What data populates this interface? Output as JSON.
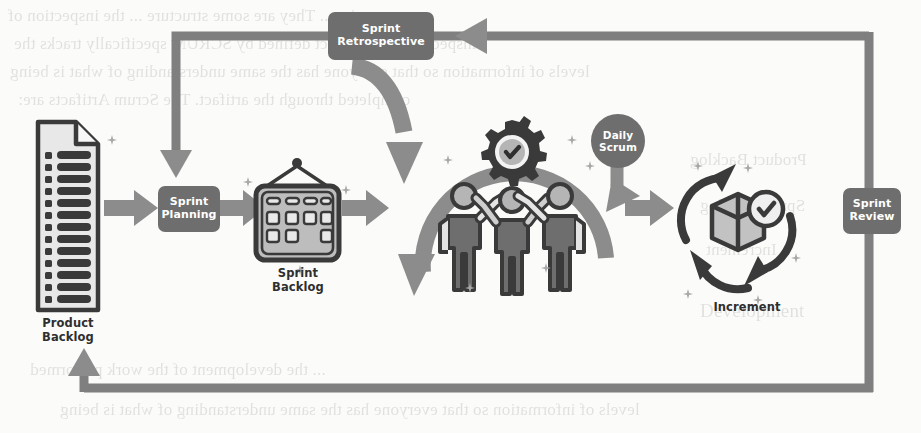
{
  "diagram": {
    "colors": {
      "badge_fill": "#6e6e6e",
      "badge_text": "#ffffff",
      "arrow_gray": "#8c8c8c",
      "line_gray": "#7f7f7f",
      "icon_dark": "#3a3a3a",
      "icon_fill": "#b7b7b7",
      "icon_light": "#e3e3e3",
      "caption_text": "#2f2f2f",
      "background": "#fbfbf9"
    },
    "nodes": [
      {
        "id": "product-backlog",
        "label": "Product\nBacklog",
        "line1": "Product",
        "line2": "Backlog",
        "kind": "caption",
        "icon": "document-checklist-icon"
      },
      {
        "id": "sprint-backlog",
        "label": "Sprint\nBacklog",
        "line1": "Sprint",
        "line2": "Backlog",
        "kind": "caption",
        "icon": "hanging-board-icon"
      },
      {
        "id": "increment",
        "label": "Increment",
        "line1": "Increment",
        "line2": "",
        "kind": "caption",
        "icon": "box-cycle-check-icon"
      }
    ],
    "badges": [
      {
        "id": "sprint-planning",
        "line1": "Sprint",
        "line2": "Planning",
        "shape": "rounded"
      },
      {
        "id": "sprint-retrospective",
        "line1": "Sprint",
        "line2": "Retrospective",
        "shape": "rounded"
      },
      {
        "id": "sprint-review",
        "line1": "Sprint",
        "line2": "Review",
        "shape": "rounded"
      },
      {
        "id": "daily-scrum",
        "line1": "Daily",
        "line2": "Scrum",
        "shape": "circle"
      }
    ],
    "background_page_text": {
      "lines": [
        "rig. ... They are some structure ... the inspection of",
        "inspection. The artifact defined by SCRUM specifically tracks the",
        "levels of information so that everyone has the same understanding of what is being",
        "completed through the artifact. The Scrum Artifacts are:",
        "Product Backlog",
        "Sprint Backlog",
        "Increment",
        "Development",
        "... the development of the work performed"
      ]
    }
  }
}
